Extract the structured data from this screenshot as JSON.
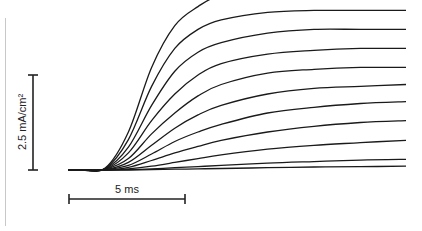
{
  "figure": {
    "scale_bars": {
      "vertical_label": "2.5 mA/cm²",
      "horizontal_label": "5 ms"
    }
  },
  "chart_data": {
    "type": "line",
    "title": "",
    "xlabel": "",
    "ylabel": "",
    "grid": false,
    "legend": "none",
    "scale_bars": {
      "vertical": "2.5 mA/cm²",
      "horizontal": "5 ms"
    },
    "x_units": "ms",
    "y_units": "mA/cm²",
    "x": [
      0,
      1,
      2,
      3,
      4,
      5,
      6,
      8,
      10,
      12,
      14
    ],
    "series": [
      {
        "name": "trace-1",
        "values": [
          0,
          0.05,
          1.0,
          2.7,
          3.8,
          4.3,
          4.6,
          4.75,
          4.8,
          4.8,
          4.8
        ]
      },
      {
        "name": "trace-2",
        "values": [
          0,
          0.04,
          0.8,
          2.2,
          3.2,
          3.7,
          3.95,
          4.15,
          4.2,
          4.2,
          4.2
        ]
      },
      {
        "name": "trace-3",
        "values": [
          0,
          0.03,
          0.6,
          1.7,
          2.6,
          3.1,
          3.35,
          3.6,
          3.7,
          3.7,
          3.7
        ]
      },
      {
        "name": "trace-4",
        "values": [
          0,
          0.02,
          0.45,
          1.3,
          2.0,
          2.5,
          2.8,
          3.05,
          3.15,
          3.2,
          3.2
        ]
      },
      {
        "name": "trace-5",
        "values": [
          0,
          0.02,
          0.3,
          0.95,
          1.5,
          1.95,
          2.25,
          2.55,
          2.65,
          2.7,
          2.7
        ]
      },
      {
        "name": "trace-6",
        "values": [
          0,
          0.01,
          0.2,
          0.65,
          1.1,
          1.45,
          1.7,
          2.0,
          2.15,
          2.2,
          2.25
        ]
      },
      {
        "name": "trace-7",
        "values": [
          0,
          0.01,
          0.12,
          0.42,
          0.75,
          1.0,
          1.2,
          1.5,
          1.65,
          1.75,
          1.8
        ]
      },
      {
        "name": "trace-8",
        "values": [
          0,
          0.0,
          0.07,
          0.25,
          0.45,
          0.62,
          0.78,
          1.0,
          1.15,
          1.25,
          1.3
        ]
      },
      {
        "name": "trace-9",
        "values": [
          0,
          0.0,
          0.03,
          0.1,
          0.2,
          0.3,
          0.4,
          0.55,
          0.65,
          0.72,
          0.78
        ]
      },
      {
        "name": "trace-10",
        "values": [
          0,
          0.0,
          0.01,
          0.03,
          0.06,
          0.09,
          0.12,
          0.18,
          0.22,
          0.26,
          0.28
        ]
      },
      {
        "name": "trace-11",
        "values": [
          0,
          0.0,
          0.0,
          0.01,
          0.02,
          0.03,
          0.04,
          0.06,
          0.08,
          0.09,
          0.1
        ]
      }
    ]
  }
}
